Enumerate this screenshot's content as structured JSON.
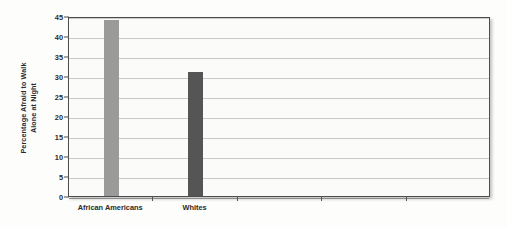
{
  "chart_data": {
    "type": "bar",
    "title": "",
    "subtitle": "",
    "xlabel": "",
    "ylabel_line1": "Percentage Afraid to Walk",
    "ylabel_line2": "Alone at Night",
    "categories": [
      "African Americans",
      "Whites"
    ],
    "values": [
      44,
      31
    ],
    "series": [
      {
        "name": "Percentage Afraid to Walk Alone at Night",
        "values": [
          44,
          31
        ]
      }
    ],
    "bar_colors": [
      "#9a9a9a",
      "#555555"
    ],
    "ylim": [
      0,
      45
    ],
    "yticks": [
      0,
      5,
      10,
      15,
      20,
      25,
      30,
      35,
      40,
      45
    ],
    "ytick_labels": [
      "0",
      "5",
      "10",
      "15",
      "20",
      "25",
      "30",
      "35",
      "40",
      "45"
    ],
    "grid": true,
    "grid_axis": "y",
    "legend": false,
    "legend_position": "none",
    "n_category_slots": 5,
    "annotations": []
  },
  "style": {
    "plot_background": "#fbfbfa",
    "page_background": "#fdfdfc",
    "frame_color": "#4e4e4e",
    "gridline_color": "#c9c9c9",
    "text_color": "#2b2b2b"
  }
}
